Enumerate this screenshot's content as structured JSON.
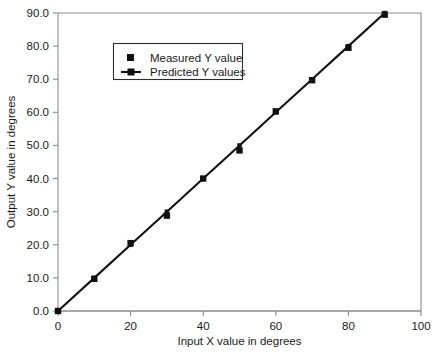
{
  "chart_data": {
    "type": "scatter",
    "title": "",
    "xlabel": "Input X value in degrees",
    "ylabel": "Output Y value in degrees",
    "xlim": [
      0,
      100
    ],
    "ylim": [
      0.0,
      90.0
    ],
    "xticks": [
      0,
      20,
      40,
      60,
      80,
      100
    ],
    "xtick_labels": [
      "0",
      "20",
      "40",
      "60",
      "80",
      "100"
    ],
    "yticks": [
      0.0,
      10.0,
      20.0,
      30.0,
      40.0,
      50.0,
      60.0,
      70.0,
      80.0,
      90.0
    ],
    "ytick_labels": [
      "0.0",
      "10.0",
      "20.0",
      "30.0",
      "40.0",
      "50.0",
      "60.0",
      "70.0",
      "80.0",
      "90.0"
    ],
    "grid": false,
    "legend_position": "upper-left-inside",
    "x": [
      0,
      10,
      20,
      30,
      40,
      50,
      60,
      70,
      80,
      90
    ],
    "series": [
      {
        "name": "Measured Y value",
        "marker": "square",
        "line": false,
        "color": "#111111",
        "values": [
          0.0,
          9.7,
          20.5,
          28.8,
          40.0,
          48.5,
          60.3,
          69.7,
          79.5,
          89.5
        ]
      },
      {
        "name": "Predicted Y values",
        "marker": "line-with-square",
        "line": true,
        "color": "#111111",
        "values": [
          0.0,
          10.0,
          20.0,
          30.0,
          40.0,
          50.0,
          60.0,
          70.0,
          80.0,
          90.0
        ]
      }
    ]
  },
  "legend": {
    "entries": [
      {
        "label": "Measured Y value",
        "marker": "square-marker"
      },
      {
        "label": "Predicted Y values",
        "marker": "line-square-marker"
      }
    ]
  },
  "colors": {
    "series": "#111111",
    "axis": "#8c8c8c",
    "text": "#1a1a1a",
    "background": "#ffffff",
    "legend_border": "#2b2b2b"
  }
}
